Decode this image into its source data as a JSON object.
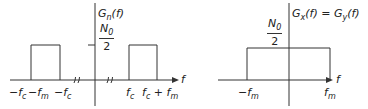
{
  "left_graph": {
    "title": "G_n(f)",
    "title_main": "G",
    "title_sub": "n",
    "title_arg": "(f)",
    "level_num": "N",
    "level_num_sub": "0",
    "level_den": "2",
    "axis_label": "f",
    "ticks": {
      "neg_fc_minus_fm_a": "−f",
      "neg_fc_minus_fm_a_sub": "c",
      "neg_fc_minus_fm_b": "−f",
      "neg_fc_minus_fm_b_sub": "m",
      "neg_fc": "−f",
      "neg_fc_sub": "c",
      "fc": "f",
      "fc_sub": "c",
      "fc_plus_fm_a": "f",
      "fc_plus_fm_a_sub": "c",
      "fc_plus_fm_plus": " + f",
      "fc_plus_fm_b_sub": "m"
    }
  },
  "right_graph": {
    "title": "G_x(f) = G_y(f)",
    "title_a": "G",
    "title_a_sub": "x",
    "title_mid": "(f) = G",
    "title_b_sub": "y",
    "title_end": "(f)",
    "level_num": "N",
    "level_num_sub": "0",
    "level_den": "2",
    "axis_label": "f",
    "ticks": {
      "neg_fm": "−f",
      "neg_fm_sub": "m",
      "fm": "f",
      "fm_sub": "m"
    }
  },
  "colors": {
    "line": "#333333",
    "background": "#ffffff"
  }
}
